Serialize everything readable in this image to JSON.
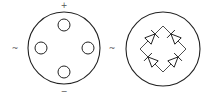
{
  "diagram": {
    "colors": {
      "line": "#222222",
      "label": "#555555",
      "background": "#ffffff"
    },
    "package_view": {
      "outline": {
        "cx": 64,
        "cy": 48,
        "r": 36
      },
      "pins": [
        {
          "name": "positive",
          "cx": 64,
          "cy": 25,
          "r": 6,
          "label": "+",
          "label_x": 64,
          "label_y": 8
        },
        {
          "name": "ac-left",
          "cx": 41,
          "cy": 48,
          "r": 6,
          "label": "~",
          "label_x": 15,
          "label_y": 51
        },
        {
          "name": "ac-right",
          "cx": 88,
          "cy": 48,
          "r": 6,
          "label": "~",
          "label_x": 112,
          "label_y": 51
        },
        {
          "name": "negative",
          "cx": 64,
          "cy": 72,
          "r": 6,
          "label": "−",
          "label_x": 64,
          "label_y": 94
        }
      ]
    },
    "schematic_view": {
      "outline": {
        "cx": 163,
        "cy": 49,
        "r": 37
      },
      "bridge": {
        "top": [
          163,
          26
        ],
        "left": [
          140,
          49
        ],
        "bottom": [
          163,
          72
        ],
        "right": [
          186,
          49
        ]
      },
      "diodes": [
        {
          "name": "diode-top-left",
          "from": "left",
          "to": "top"
        },
        {
          "name": "diode-top-right",
          "from": "right",
          "to": "top"
        },
        {
          "name": "diode-bottom-left",
          "from": "bottom",
          "to": "left"
        },
        {
          "name": "diode-bottom-right",
          "from": "bottom",
          "to": "right"
        }
      ]
    }
  }
}
